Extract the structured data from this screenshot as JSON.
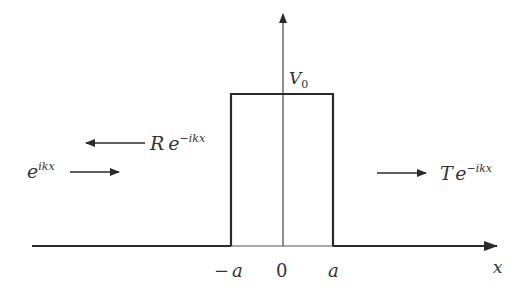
{
  "diagram": {
    "colors": {
      "line": "#2a2a2a",
      "text": "#333333",
      "background": "#ffffff"
    },
    "axes": {
      "x_label": "x",
      "ticks": [
        {
          "label_sign": "−",
          "label": "a",
          "x": 231
        },
        {
          "label": "0",
          "x": 283
        },
        {
          "label": "a",
          "x": 333
        }
      ]
    },
    "barrier": {
      "height_label": "V",
      "height_subscript": "0"
    },
    "waves": {
      "incident": {
        "base": "e",
        "exponent": "ikx",
        "direction": "right"
      },
      "reflected": {
        "coefficient": "R",
        "base": "e",
        "exponent": "−ikx",
        "direction": "left"
      },
      "transmitted": {
        "coefficient": "T",
        "base": "e",
        "exponent": "−ikx",
        "direction": "right"
      }
    }
  }
}
